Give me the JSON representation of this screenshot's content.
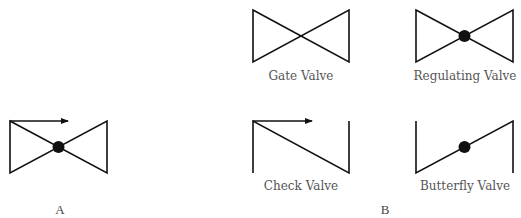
{
  "diagram": {
    "panel_a": {
      "letter": "A",
      "symbol": "regulating-valve-with-flow-arrow-icon"
    },
    "panel_b": {
      "letter": "B",
      "symbols": [
        {
          "label": "Gate Valve",
          "icon": "gate-valve-icon"
        },
        {
          "label": "Regulating Valve",
          "icon": "regulating-valve-icon"
        },
        {
          "label": "Check Valve",
          "icon": "check-valve-icon"
        },
        {
          "label": "Butterfly Valve",
          "icon": "butterfly-valve-icon"
        }
      ]
    },
    "colors": {
      "line": "#111111",
      "label": "#555555",
      "background": "#ffffff"
    }
  }
}
